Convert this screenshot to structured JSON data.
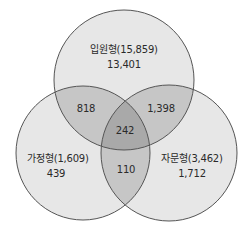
{
  "colors": {
    "single": "#e7e7e7",
    "double": "#c6c6c6",
    "triple": "#a9a9a9",
    "stroke": "#555555",
    "text": "#2a2a2a"
  },
  "sets": [
    {
      "id": "inpatient",
      "label": "입원형(15,859)",
      "only": "13,401"
    },
    {
      "id": "home",
      "label": "가정형(1,609)",
      "only": "439"
    },
    {
      "id": "advisory",
      "label": "자문형(3,462)",
      "only": "1,712"
    }
  ],
  "overlaps": {
    "inpatient_home": "818",
    "inpatient_advisory": "1,398",
    "home_advisory": "110",
    "all_three": "242"
  }
}
